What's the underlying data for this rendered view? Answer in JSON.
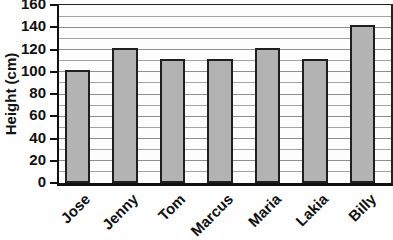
{
  "chart_data": {
    "type": "bar",
    "categories": [
      "Jose",
      "Jenny",
      "Tom",
      "Marcus",
      "Maria",
      "Lakia",
      "Billy"
    ],
    "values": [
      100,
      120,
      110,
      110,
      120,
      110,
      140
    ],
    "title": "",
    "xlabel": "",
    "ylabel": "Height (cm)",
    "ylim": [
      0,
      160
    ],
    "ytick_step": 20,
    "grid_step": 10,
    "grid": "on",
    "legend": "none",
    "colors": {
      "bar_fill": "#b3b3b3",
      "bar_border": "#1f1f1f",
      "gridline": "#a3a3a3",
      "axis": "#111111",
      "text": "#111111",
      "background": "#fefefe"
    }
  }
}
